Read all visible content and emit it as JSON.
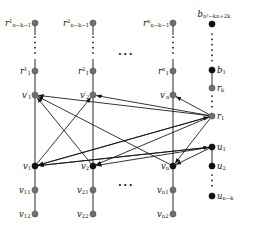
{
  "figure": {
    "type": "graph-diagram",
    "width": 257,
    "height": 229,
    "background": "#ffffff",
    "node_colors": {
      "gray": "#6f6f6f",
      "black": "#111111"
    },
    "edge_color": "#111111"
  },
  "columns": [
    {
      "id": "col1",
      "x": 35,
      "nodes": [
        {
          "name": "r-1-top",
          "y": 23,
          "color": "gray",
          "label": "r",
          "sup": "1",
          "sub": "n−k−1",
          "label_side": "left"
        },
        {
          "name": "r-1-1",
          "y": 71,
          "color": "gray",
          "label": "r",
          "sup": "1",
          "sub": "1",
          "label_side": "left"
        },
        {
          "name": "v-1-prime",
          "y": 95,
          "color": "gray",
          "label": "v",
          "sup": "′",
          "sub": "1",
          "label_side": "left"
        },
        {
          "name": "v-1",
          "y": 166,
          "color": "black",
          "label": "v",
          "sup": "",
          "sub": "1",
          "label_side": "left"
        },
        {
          "name": "v-11",
          "y": 190,
          "color": "gray",
          "label": "v",
          "sup": "",
          "sub": "11",
          "label_side": "left"
        },
        {
          "name": "v-12",
          "y": 214,
          "color": "gray",
          "label": "v",
          "sup": "",
          "sub": "12",
          "label_side": "left"
        }
      ],
      "vdots_y": 47
    },
    {
      "id": "col2",
      "x": 93,
      "nodes": [
        {
          "name": "r-2-top",
          "y": 23,
          "color": "gray",
          "label": "r",
          "sup": "2",
          "sub": "n−k−1",
          "label_side": "left"
        },
        {
          "name": "r-2-1",
          "y": 71,
          "color": "gray",
          "label": "r",
          "sup": "2",
          "sub": "1",
          "label_side": "left"
        },
        {
          "name": "v-2-prime",
          "y": 95,
          "color": "gray",
          "label": "v",
          "sup": "′",
          "sub": "2",
          "label_side": "left"
        },
        {
          "name": "v-2",
          "y": 166,
          "color": "black",
          "label": "v",
          "sup": "",
          "sub": "2",
          "label_side": "left"
        },
        {
          "name": "v-21",
          "y": 190,
          "color": "gray",
          "label": "v",
          "sup": "",
          "sub": "21",
          "label_side": "left"
        },
        {
          "name": "v-22",
          "y": 214,
          "color": "gray",
          "label": "v",
          "sup": "",
          "sub": "22",
          "label_side": "left"
        }
      ],
      "vdots_y": 47
    },
    {
      "id": "coln",
      "x": 173,
      "nodes": [
        {
          "name": "r-n-top",
          "y": 23,
          "color": "gray",
          "label": "r",
          "sup": "n",
          "sub": "n−k−1",
          "label_side": "left"
        },
        {
          "name": "r-n-1",
          "y": 71,
          "color": "gray",
          "label": "r",
          "sup": "n",
          "sub": "1",
          "label_side": "left"
        },
        {
          "name": "v-n-prime",
          "y": 95,
          "color": "gray",
          "label": "v",
          "sup": "′",
          "sub": "n",
          "label_side": "left"
        },
        {
          "name": "v-n",
          "y": 166,
          "color": "black",
          "label": "v",
          "sup": "",
          "sub": "n",
          "label_side": "left"
        },
        {
          "name": "v-n1",
          "y": 190,
          "color": "gray",
          "label": "v",
          "sup": "",
          "sub": "n1",
          "label_side": "left"
        },
        {
          "name": "v-n2",
          "y": 214,
          "color": "gray",
          "label": "v",
          "sup": "",
          "sub": "n2",
          "label_side": "left"
        }
      ],
      "vdots_y": 47
    },
    {
      "id": "colr",
      "x": 212,
      "nodes": [
        {
          "name": "b-top",
          "y": 24,
          "color": "black",
          "label": "b",
          "sup": "",
          "sub": "n²−kn+2k",
          "label_side": "above"
        },
        {
          "name": "b-1",
          "y": 70,
          "color": "black",
          "label": "b",
          "sup": "",
          "sub": "1",
          "label_side": "right"
        },
        {
          "name": "r-k",
          "y": 88,
          "color": "gray",
          "label": "r",
          "sup": "",
          "sub": "k",
          "label_side": "right"
        },
        {
          "name": "r-1",
          "y": 116,
          "color": "gray",
          "label": "r",
          "sup": "",
          "sub": "1",
          "label_side": "right"
        },
        {
          "name": "u-1",
          "y": 147,
          "color": "black",
          "label": "u",
          "sup": "",
          "sub": "1",
          "label_side": "right"
        },
        {
          "name": "u-2",
          "y": 166,
          "color": "black",
          "label": "u",
          "sup": "",
          "sub": "2",
          "label_side": "right"
        },
        {
          "name": "u-n-k",
          "y": 196,
          "color": "black",
          "label": "u",
          "sup": "",
          "sub": "n−k",
          "label_side": "right"
        }
      ],
      "vdots": [
        {
          "y0": 34,
          "y1": 62
        },
        {
          "y0": 96,
          "y1": 110
        },
        {
          "y0": 175,
          "y1": 189
        }
      ]
    }
  ],
  "ellipses": [
    {
      "name": "ellipsis-top",
      "x": 126,
      "y": 54,
      "text": "···"
    },
    {
      "name": "ellipsis-bottom",
      "x": 126,
      "y": 185,
      "text": "···"
    }
  ],
  "vertical_chains": [
    {
      "name": "chain-col1-upper",
      "x": 35,
      "y0": 71,
      "y1": 166
    },
    {
      "name": "chain-col1-lower",
      "x": 35,
      "y0": 166,
      "y1": 214
    },
    {
      "name": "chain-col2-upper",
      "x": 93,
      "y0": 71,
      "y1": 166
    },
    {
      "name": "chain-col2-lower",
      "x": 93,
      "y0": 166,
      "y1": 214
    },
    {
      "name": "chain-coln-upper",
      "x": 173,
      "y0": 71,
      "y1": 166
    },
    {
      "name": "chain-coln-lower",
      "x": 173,
      "y0": 166,
      "y1": 214
    },
    {
      "name": "chain-colr-b",
      "x": 212,
      "y0": 70,
      "y1": 88
    },
    {
      "name": "chain-colr-u",
      "x": 212,
      "y0": 147,
      "y1": 166
    }
  ],
  "arrows": [
    {
      "name": "arrow-v1-to-v2prime",
      "x1": 35,
      "y1": 166,
      "x2": 93,
      "y2": 95
    },
    {
      "name": "arrow-v2-to-v1prime",
      "x1": 93,
      "y1": 166,
      "x2": 35,
      "y2": 95
    },
    {
      "name": "arrow-vn-to-v1prime",
      "x1": 173,
      "y1": 166,
      "x2": 35,
      "y2": 95
    },
    {
      "name": "arrow-r1-to-v1prime",
      "x1": 212,
      "y1": 116,
      "x2": 35,
      "y2": 95
    },
    {
      "name": "arrow-r1-to-v2prime",
      "x1": 212,
      "y1": 116,
      "x2": 93,
      "y2": 95
    },
    {
      "name": "arrow-r1-to-vnprime",
      "x1": 212,
      "y1": 116,
      "x2": 173,
      "y2": 95
    },
    {
      "name": "arrow-r1-to-v1",
      "x1": 212,
      "y1": 116,
      "x2": 35,
      "y2": 166
    },
    {
      "name": "arrow-r1-to-v2",
      "x1": 212,
      "y1": 116,
      "x2": 93,
      "y2": 166
    },
    {
      "name": "arrow-r1-to-vn",
      "x1": 212,
      "y1": 116,
      "x2": 173,
      "y2": 166
    },
    {
      "name": "arrow-u1-to-v1",
      "x1": 212,
      "y1": 147,
      "x2": 35,
      "y2": 166
    },
    {
      "name": "arrow-u1-to-v2",
      "x1": 212,
      "y1": 147,
      "x2": 93,
      "y2": 166
    },
    {
      "name": "arrow-u1-to-vn",
      "x1": 212,
      "y1": 147,
      "x2": 173,
      "y2": 166
    },
    {
      "name": "arrow-v1-to-u1",
      "x1": 35,
      "y1": 166,
      "x2": 212,
      "y2": 147
    },
    {
      "name": "arrow-v1-to-r1",
      "x1": 35,
      "y1": 166,
      "x2": 212,
      "y2": 116
    }
  ]
}
